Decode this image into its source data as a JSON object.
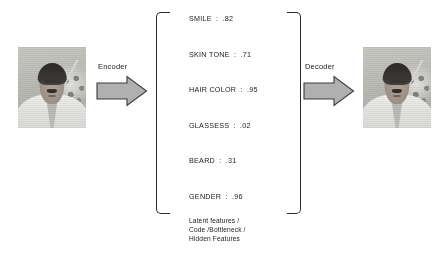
{
  "diagram": {
    "input_photo": {
      "alt": "grayscale portrait photo of a man in a light checked shirt"
    },
    "output_photo": {
      "alt": "reconstructed grayscale portrait photo of a man in a light checked shirt"
    },
    "encoder": {
      "label": "Encoder",
      "icon": "right-block-arrow-icon"
    },
    "decoder": {
      "label": "Decoder",
      "icon": "right-block-arrow-icon"
    },
    "latent": {
      "features": [
        {
          "name": "SMILE",
          "separator": ":",
          "value": ".82"
        },
        {
          "name": "SKIN TONE",
          "separator": ":",
          "value": ".71"
        },
        {
          "name": "HAIR COLOR",
          "separator": ":",
          "value": ".95"
        },
        {
          "name": "GLASSESS",
          "separator": ":",
          "value": ".02"
        },
        {
          "name": "BEARD",
          "separator": ":",
          "value": ".31"
        },
        {
          "name": "GENDER",
          "separator": ":",
          "value": ".96"
        }
      ],
      "caption_lines": [
        "Latent features /",
        "Code /Bottleneck /",
        "Hidden Features"
      ]
    },
    "colors": {
      "background": "#ffffff",
      "text": "#1a1a1a",
      "arrow_fill": "#b0b0b0",
      "arrow_stroke": "#3a3a3a",
      "bracket_stroke": "#2b2b2b"
    }
  }
}
